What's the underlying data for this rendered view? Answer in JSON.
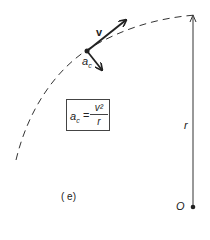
{
  "diagram": {
    "labels": {
      "velocity": "v",
      "accel_base": "a",
      "accel_sub": "c",
      "radius": "r",
      "origin": "O",
      "panel": "( e)"
    },
    "formula": {
      "lhs_base": "a",
      "lhs_sub": "c",
      "equals": "=",
      "numerator": "v²",
      "denominator": "r"
    },
    "colors": {
      "stroke": "#222222",
      "background": "#ffffff"
    }
  }
}
